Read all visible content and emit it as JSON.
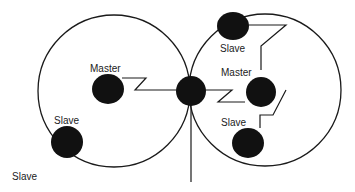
{
  "diagram": {
    "type": "bluetooth-scatternet",
    "piconets": [
      {
        "id": "left",
        "master": "Master",
        "slaves": [
          "Slave",
          "Slave"
        ]
      },
      {
        "id": "right",
        "master": "Master",
        "slaves": [
          "Slave",
          "Slave"
        ]
      }
    ],
    "bridge_node": "shared node between piconets",
    "labels": {
      "left_master": "Master",
      "left_slave": "Slave",
      "outer_slave": "Slave",
      "right_top_slave": "Slave",
      "right_master": "Master",
      "right_bottom_slave": "Slave"
    },
    "colors": {
      "node": "#111111",
      "line": "#1a1a1a",
      "background": "#ffffff"
    }
  }
}
